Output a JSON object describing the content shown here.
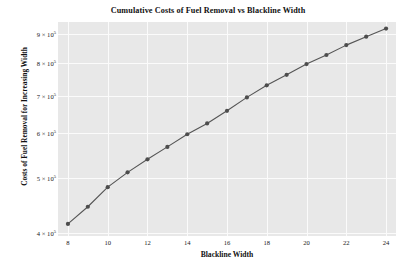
{
  "chart_data": {
    "type": "line",
    "title": "Cumulative Costs of Fuel Removal vs Blackline Width",
    "xlabel": "Blackline Width",
    "ylabel": "Costs of Fuel Removal for Increasing Width",
    "x": [
      8,
      9,
      10,
      11,
      12,
      13,
      14,
      15,
      16,
      17,
      18,
      19,
      20,
      21,
      22,
      23,
      24
    ],
    "values": [
      415000,
      445000,
      482000,
      512000,
      540000,
      568000,
      598000,
      625000,
      658000,
      695000,
      730000,
      762000,
      796000,
      826000,
      860000,
      890000,
      920000
    ],
    "series": [
      {
        "name": "Cumulative Cost",
        "values": [
          415000,
          445000,
          482000,
          512000,
          540000,
          568000,
          598000,
          625000,
          658000,
          695000,
          730000,
          762000,
          796000,
          826000,
          860000,
          890000,
          920000
        ]
      }
    ],
    "xlim": [
      7.5,
      24.5
    ],
    "ylim": [
      395000,
      945000
    ],
    "yscale": "log",
    "xscale": "linear",
    "grid": true,
    "legend": false,
    "marker": "circle",
    "line_color": "#555555",
    "marker_color": "#4d4d4d",
    "plot_background": "#e8e8e8",
    "grid_color": "#fbfbfb",
    "xticks": [
      {
        "value": 8,
        "label": "8"
      },
      {
        "value": 10,
        "label": "10"
      },
      {
        "value": 12,
        "label": "12"
      },
      {
        "value": 14,
        "label": "14"
      },
      {
        "value": 16,
        "label": "16"
      },
      {
        "value": 18,
        "label": "18"
      },
      {
        "value": 20,
        "label": "20"
      },
      {
        "value": 22,
        "label": "22"
      },
      {
        "value": 24,
        "label": "24"
      }
    ],
    "yticks": [
      {
        "value": 400000,
        "mantissa": "4",
        "times": "×",
        "base": "10",
        "exponent": "5"
      },
      {
        "value": 500000,
        "mantissa": "5",
        "times": "×",
        "base": "10",
        "exponent": "5"
      },
      {
        "value": 600000,
        "mantissa": "6",
        "times": "×",
        "base": "10",
        "exponent": "5"
      },
      {
        "value": 700000,
        "mantissa": "7",
        "times": "×",
        "base": "10",
        "exponent": "5"
      },
      {
        "value": 800000,
        "mantissa": "8",
        "times": "×",
        "base": "10",
        "exponent": "5"
      },
      {
        "value": 900000,
        "mantissa": "9",
        "times": "×",
        "base": "10",
        "exponent": "5"
      }
    ]
  }
}
